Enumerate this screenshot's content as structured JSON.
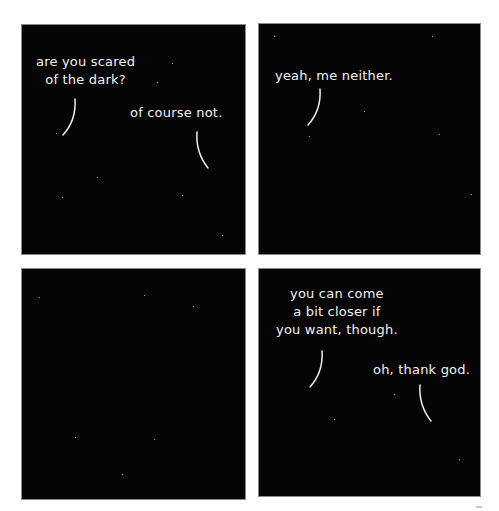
{
  "comic": {
    "panel_count": 4,
    "colors": {
      "panel_background": "#050505",
      "text": "#f2f2f2",
      "page_background": "#ffffff"
    },
    "panels": [
      {
        "index": 1,
        "dialogue": [
          {
            "speaker": "left",
            "text": "are you scared\nof the dark?"
          },
          {
            "speaker": "right",
            "text": "of course not."
          }
        ]
      },
      {
        "index": 2,
        "dialogue": [
          {
            "speaker": "left",
            "text": "yeah, me neither."
          }
        ]
      },
      {
        "index": 3,
        "dialogue": []
      },
      {
        "index": 4,
        "dialogue": [
          {
            "speaker": "left",
            "text": "you can come\na bit closer if\nyou want, though."
          },
          {
            "speaker": "right",
            "text": "oh, thank god."
          }
        ]
      }
    ]
  }
}
